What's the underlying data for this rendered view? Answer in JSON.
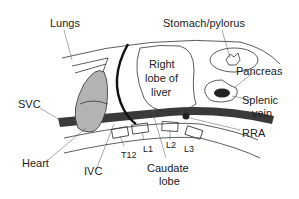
{
  "diagram": {
    "labels": {
      "lungs": "Lungs",
      "stomach": "Stomach/pylorus",
      "right_lobe_line1": "Right",
      "right_lobe_line2": "lobe of",
      "right_lobe_line3": "liver",
      "pancreas": "Pancreas",
      "splenic_line1": "Splenic",
      "splenic_line2": "vein",
      "svc": "SVC",
      "rra": "RRA",
      "heart": "Heart",
      "ivc": "IVC",
      "caudate_line1": "Caudate",
      "caudate_line2": "lobe",
      "t12": "T12",
      "l1": "L1",
      "l2": "L2",
      "l3": "L3"
    },
    "colors": {
      "heart_fill": "#b3b3b3",
      "vessel_fill": "#3a3a3a",
      "outline": "#222222",
      "background": "#ffffff"
    }
  }
}
